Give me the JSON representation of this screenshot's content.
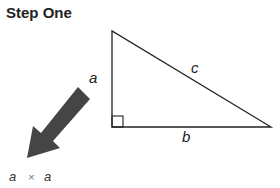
{
  "title": "Step One",
  "diagram": {
    "shape": "right-triangle",
    "labels": {
      "a": "a",
      "b": "b",
      "c": "c"
    },
    "arrow_color": "#444444",
    "formula": {
      "left": "a",
      "op": "×",
      "right": "a"
    }
  }
}
